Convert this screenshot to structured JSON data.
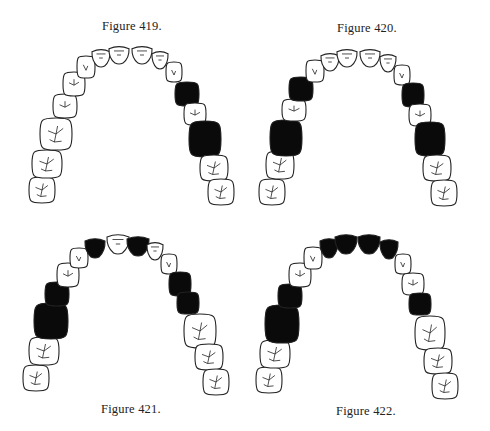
{
  "page": {
    "background": "#ffffff",
    "ink": "#0a0a0a"
  },
  "figures": [
    {
      "id": "fig-419",
      "caption": "Figure 419.",
      "caption_pos": [
        102,
        19
      ],
      "teeth": [
        {
          "x": 42,
          "y": 190,
          "rx": 13,
          "ry": 13,
          "type": "molar",
          "filled": false
        },
        {
          "x": 47,
          "y": 164,
          "rx": 15,
          "ry": 14,
          "type": "molar",
          "filled": false
        },
        {
          "x": 56,
          "y": 134,
          "rx": 16,
          "ry": 16,
          "type": "molar",
          "filled": false
        },
        {
          "x": 65,
          "y": 106,
          "rx": 12,
          "ry": 12,
          "type": "premolar",
          "filled": false
        },
        {
          "x": 74,
          "y": 84,
          "rx": 11,
          "ry": 12,
          "type": "premolar",
          "filled": false
        },
        {
          "x": 86,
          "y": 67,
          "rx": 9,
          "ry": 11,
          "type": "canine",
          "filled": false
        },
        {
          "x": 101,
          "y": 58,
          "rx": 9,
          "ry": 9,
          "type": "incisor",
          "filled": false
        },
        {
          "x": 119,
          "y": 55,
          "rx": 10,
          "ry": 9,
          "type": "incisor",
          "filled": false
        },
        {
          "x": 142,
          "y": 55,
          "rx": 10,
          "ry": 9,
          "type": "incisor",
          "filled": false
        },
        {
          "x": 160,
          "y": 60,
          "rx": 8,
          "ry": 9,
          "type": "incisor",
          "filled": false
        },
        {
          "x": 174,
          "y": 72,
          "rx": 8,
          "ry": 10,
          "type": "canine",
          "filled": false
        },
        {
          "x": 187,
          "y": 94,
          "rx": 12,
          "ry": 12,
          "type": "premolar",
          "filled": true
        },
        {
          "x": 195,
          "y": 114,
          "rx": 11,
          "ry": 11,
          "type": "premolar",
          "filled": false
        },
        {
          "x": 205,
          "y": 139,
          "rx": 16,
          "ry": 18,
          "type": "molar",
          "filled": true
        },
        {
          "x": 214,
          "y": 168,
          "rx": 14,
          "ry": 13,
          "type": "molar",
          "filled": false
        },
        {
          "x": 221,
          "y": 192,
          "rx": 13,
          "ry": 13,
          "type": "molar",
          "filled": false
        }
      ]
    },
    {
      "id": "fig-420",
      "caption": "Figure 420.",
      "caption_pos": [
        337,
        21
      ],
      "teeth": [
        {
          "x": 272,
          "y": 192,
          "rx": 13,
          "ry": 13,
          "type": "molar",
          "filled": false
        },
        {
          "x": 280,
          "y": 165,
          "rx": 14,
          "ry": 14,
          "type": "molar",
          "filled": false
        },
        {
          "x": 286,
          "y": 138,
          "rx": 16,
          "ry": 18,
          "type": "molar",
          "filled": true
        },
        {
          "x": 294,
          "y": 110,
          "rx": 12,
          "ry": 11,
          "type": "premolar",
          "filled": false
        },
        {
          "x": 301,
          "y": 89,
          "rx": 12,
          "ry": 12,
          "type": "premolar",
          "filled": true
        },
        {
          "x": 315,
          "y": 71,
          "rx": 9,
          "ry": 11,
          "type": "canine",
          "filled": false
        },
        {
          "x": 330,
          "y": 62,
          "rx": 9,
          "ry": 9,
          "type": "incisor",
          "filled": false
        },
        {
          "x": 347,
          "y": 58,
          "rx": 10,
          "ry": 9,
          "type": "incisor",
          "filled": false
        },
        {
          "x": 370,
          "y": 58,
          "rx": 10,
          "ry": 9,
          "type": "incisor",
          "filled": false
        },
        {
          "x": 388,
          "y": 63,
          "rx": 8,
          "ry": 9,
          "type": "incisor",
          "filled": false
        },
        {
          "x": 402,
          "y": 75,
          "rx": 8,
          "ry": 10,
          "type": "canine",
          "filled": false
        },
        {
          "x": 413,
          "y": 95,
          "rx": 11,
          "ry": 12,
          "type": "premolar",
          "filled": true
        },
        {
          "x": 420,
          "y": 115,
          "rx": 11,
          "ry": 11,
          "type": "premolar",
          "filled": false
        },
        {
          "x": 430,
          "y": 139,
          "rx": 15,
          "ry": 17,
          "type": "molar",
          "filled": true
        },
        {
          "x": 437,
          "y": 168,
          "rx": 14,
          "ry": 13,
          "type": "molar",
          "filled": false
        },
        {
          "x": 444,
          "y": 193,
          "rx": 13,
          "ry": 13,
          "type": "molar",
          "filled": false
        }
      ]
    },
    {
      "id": "fig-421",
      "caption": "Figure 421.",
      "caption_pos": [
        101,
        402
      ],
      "teeth": [
        {
          "x": 36,
          "y": 378,
          "rx": 13,
          "ry": 13,
          "type": "molar",
          "filled": false
        },
        {
          "x": 44,
          "y": 351,
          "rx": 15,
          "ry": 14,
          "type": "molar",
          "filled": false
        },
        {
          "x": 51,
          "y": 321,
          "rx": 17,
          "ry": 18,
          "type": "molar",
          "filled": true
        },
        {
          "x": 57,
          "y": 294,
          "rx": 12,
          "ry": 12,
          "type": "premolar",
          "filled": true
        },
        {
          "x": 68,
          "y": 275,
          "rx": 11,
          "ry": 12,
          "type": "premolar",
          "filled": false
        },
        {
          "x": 79,
          "y": 258,
          "rx": 9,
          "ry": 10,
          "type": "canine",
          "filled": false
        },
        {
          "x": 95,
          "y": 248,
          "rx": 10,
          "ry": 10,
          "type": "incisor",
          "filled": true
        },
        {
          "x": 118,
          "y": 244,
          "rx": 11,
          "ry": 10,
          "type": "incisor",
          "filled": false
        },
        {
          "x": 138,
          "y": 246,
          "rx": 11,
          "ry": 10,
          "type": "incisor",
          "filled": true
        },
        {
          "x": 155,
          "y": 251,
          "rx": 8,
          "ry": 9,
          "type": "incisor",
          "filled": false
        },
        {
          "x": 169,
          "y": 264,
          "rx": 8,
          "ry": 10,
          "type": "canine",
          "filled": false
        },
        {
          "x": 180,
          "y": 284,
          "rx": 11,
          "ry": 12,
          "type": "premolar",
          "filled": true
        },
        {
          "x": 188,
          "y": 303,
          "rx": 11,
          "ry": 11,
          "type": "premolar",
          "filled": true
        },
        {
          "x": 200,
          "y": 331,
          "rx": 16,
          "ry": 17,
          "type": "molar",
          "filled": false
        },
        {
          "x": 209,
          "y": 357,
          "rx": 14,
          "ry": 13,
          "type": "molar",
          "filled": false
        },
        {
          "x": 216,
          "y": 382,
          "rx": 13,
          "ry": 13,
          "type": "molar",
          "filled": false
        }
      ]
    },
    {
      "id": "fig-422",
      "caption": "Figure 422.",
      "caption_pos": [
        336,
        404
      ],
      "teeth": [
        {
          "x": 269,
          "y": 380,
          "rx": 13,
          "ry": 13,
          "type": "molar",
          "filled": false
        },
        {
          "x": 275,
          "y": 354,
          "rx": 15,
          "ry": 14,
          "type": "molar",
          "filled": false
        },
        {
          "x": 282,
          "y": 324,
          "rx": 17,
          "ry": 19,
          "type": "molar",
          "filled": true
        },
        {
          "x": 290,
          "y": 296,
          "rx": 12,
          "ry": 12,
          "type": "premolar",
          "filled": true
        },
        {
          "x": 300,
          "y": 275,
          "rx": 11,
          "ry": 12,
          "type": "premolar",
          "filled": false
        },
        {
          "x": 313,
          "y": 258,
          "rx": 9,
          "ry": 11,
          "type": "canine",
          "filled": false
        },
        {
          "x": 329,
          "y": 248,
          "rx": 9,
          "ry": 10,
          "type": "incisor",
          "filled": true
        },
        {
          "x": 346,
          "y": 244,
          "rx": 11,
          "ry": 10,
          "type": "incisor",
          "filled": true
        },
        {
          "x": 369,
          "y": 244,
          "rx": 11,
          "ry": 10,
          "type": "incisor",
          "filled": true
        },
        {
          "x": 389,
          "y": 249,
          "rx": 9,
          "ry": 10,
          "type": "incisor",
          "filled": true
        },
        {
          "x": 403,
          "y": 264,
          "rx": 8,
          "ry": 10,
          "type": "canine",
          "filled": false
        },
        {
          "x": 413,
          "y": 284,
          "rx": 11,
          "ry": 11,
          "type": "premolar",
          "filled": false
        },
        {
          "x": 420,
          "y": 304,
          "rx": 11,
          "ry": 11,
          "type": "premolar",
          "filled": true
        },
        {
          "x": 430,
          "y": 333,
          "rx": 15,
          "ry": 17,
          "type": "molar",
          "filled": false
        },
        {
          "x": 438,
          "y": 361,
          "rx": 14,
          "ry": 13,
          "type": "molar",
          "filled": false
        },
        {
          "x": 445,
          "y": 386,
          "rx": 13,
          "ry": 13,
          "type": "molar",
          "filled": false
        }
      ]
    }
  ]
}
